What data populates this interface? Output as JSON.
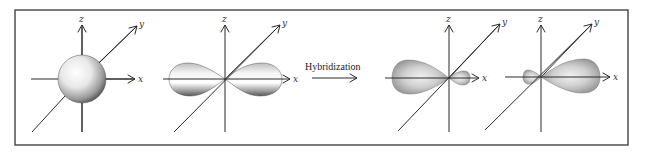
{
  "figure": {
    "frame": {
      "x": 15,
      "y": 10,
      "w": 613,
      "h": 135
    },
    "process_label": "Hybridization",
    "axis_labels": {
      "x": "x",
      "y": "y",
      "z": "z"
    },
    "panels": [
      {
        "id": "s-orbital",
        "type": "sphere",
        "center": [
          82,
          79
        ]
      },
      {
        "id": "p-orbital",
        "type": "dumbbell",
        "center": [
          225,
          79
        ]
      },
      {
        "id": "sp-hybrid-left",
        "type": "hybrid-left",
        "center": [
          449,
          78
        ]
      },
      {
        "id": "sp-hybrid-right",
        "type": "hybrid-right",
        "center": [
          541,
          77
        ]
      }
    ],
    "colors": {
      "frame": "#444444",
      "axis": "#2a2a2a",
      "orbital_light": "#ffffff",
      "orbital_dark": "#6f6f6f",
      "hybrid_fill": "#a8a8a8"
    }
  }
}
